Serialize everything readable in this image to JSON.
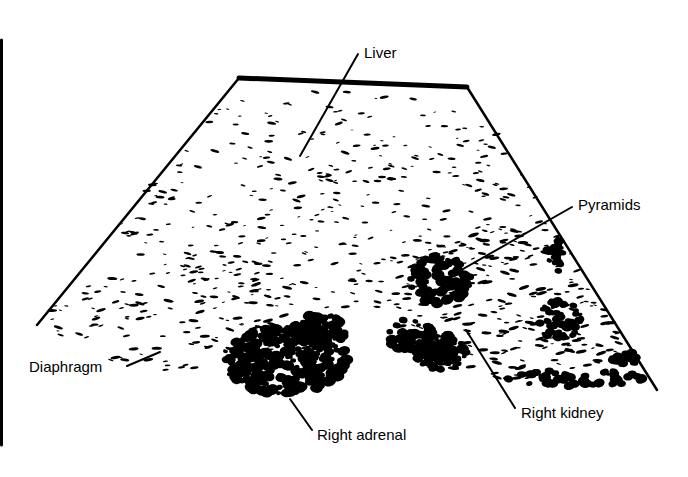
{
  "diagram": {
    "kind": "ultrasound-scan-schematic",
    "colors": {
      "ink": "#000000",
      "paper": "#ffffff"
    },
    "border_line": {
      "x": 1.5,
      "y1": 40,
      "y2": 445,
      "width": 3
    },
    "scan_sector": {
      "top_left": [
        239,
        78
      ],
      "top_right": [
        467,
        87
      ],
      "bottom_left": [
        37,
        325
      ],
      "bottom_right": [
        657,
        390
      ],
      "top_edge_width": 5,
      "side_edge_width": 2.5
    },
    "labels": [
      {
        "id": "liver",
        "text": "Liver",
        "text_pos": [
          364,
          58
        ],
        "leader": [
          [
            358,
            54
          ],
          [
            300,
            156
          ]
        ]
      },
      {
        "id": "pyramids",
        "text": "Pyramids",
        "text_pos": [
          578,
          210
        ],
        "leader": [
          [
            572,
            207
          ],
          [
            456,
            273
          ]
        ]
      },
      {
        "id": "diaphragm",
        "text": "Diaphragm",
        "text_pos": [
          29,
          372
        ],
        "leader": [
          [
            127,
            366
          ],
          [
            160,
            352
          ]
        ]
      },
      {
        "id": "right-adrenal",
        "text": "Right adrenal",
        "text_pos": [
          317,
          440
        ],
        "leader": [
          [
            312,
            430
          ],
          [
            290,
            399
          ]
        ]
      },
      {
        "id": "right-kidney",
        "text": "Right kidney",
        "text_pos": [
          521,
          418
        ],
        "leader": [
          [
            515,
            408
          ],
          [
            466,
            330
          ]
        ]
      }
    ],
    "speckle_regions": [
      {
        "name": "liver-parenchyma",
        "cx": 330,
        "cy": 200,
        "rx": 220,
        "ry": 110,
        "count": 360,
        "size": 1.6
      },
      {
        "name": "diaphragm-band",
        "cx": 190,
        "cy": 320,
        "rx": 140,
        "ry": 55,
        "count": 150,
        "size": 1.8
      },
      {
        "name": "kidney-cortex",
        "cx": 520,
        "cy": 300,
        "rx": 130,
        "ry": 80,
        "count": 230,
        "size": 2.0
      }
    ],
    "dense_regions": [
      {
        "name": "right-adrenal-mass",
        "cx": 285,
        "cy": 360,
        "rx": 62,
        "ry": 34,
        "count": 260,
        "size": 4.2
      },
      {
        "name": "adrenal-upper-lobe",
        "cx": 318,
        "cy": 330,
        "rx": 28,
        "ry": 16,
        "count": 90,
        "size": 3.8
      },
      {
        "name": "pyramid-upper",
        "cx": 440,
        "cy": 280,
        "rx": 30,
        "ry": 24,
        "count": 90,
        "size": 4.0
      },
      {
        "name": "pyramid-lower-left",
        "cx": 410,
        "cy": 335,
        "rx": 24,
        "ry": 16,
        "count": 60,
        "size": 3.8
      },
      {
        "name": "pyramid-lower",
        "cx": 440,
        "cy": 352,
        "rx": 26,
        "ry": 18,
        "count": 80,
        "size": 4.0
      },
      {
        "name": "kidney-far-cluster",
        "cx": 560,
        "cy": 320,
        "rx": 22,
        "ry": 22,
        "count": 50,
        "size": 3.4
      },
      {
        "name": "kidney-upper-right",
        "cx": 555,
        "cy": 255,
        "rx": 10,
        "ry": 18,
        "count": 25,
        "size": 3.4
      },
      {
        "name": "sinus-echo-line",
        "cx": 575,
        "cy": 378,
        "rx": 70,
        "ry": 8,
        "count": 55,
        "size": 3.6
      },
      {
        "name": "kidney-right-edge",
        "cx": 625,
        "cy": 358,
        "rx": 14,
        "ry": 8,
        "count": 22,
        "size": 3.4
      }
    ]
  }
}
